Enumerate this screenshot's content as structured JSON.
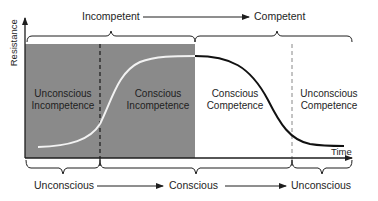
{
  "diagram": {
    "axes": {
      "y_label": "Resistance",
      "x_label": "Time"
    },
    "top_labels": {
      "left": "Incompetent",
      "right": "Competent"
    },
    "bottom_labels": {
      "left": "Unconscious",
      "middle": "Conscious",
      "right": "Unconscious"
    },
    "quadrants": [
      {
        "line1": "Unconscious",
        "line2": "Incompetence",
        "shaded": true
      },
      {
        "line1": "Conscious",
        "line2": "Incompetence",
        "shaded": true
      },
      {
        "line1": "Conscious",
        "line2": "Competence",
        "shaded": false
      },
      {
        "line1": "Unconscious",
        "line2": "Competence",
        "shaded": false
      }
    ],
    "colors": {
      "shaded_region": "#8a8a8a",
      "rising_curve": "#f2f2f2",
      "falling_curve": "#111111",
      "text_dark": "#1e1e1e",
      "text_light": "#ffffff"
    }
  }
}
